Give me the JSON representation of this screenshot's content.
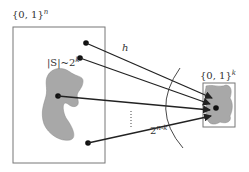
{
  "diagram": {
    "domain_label": "{0, 1}",
    "domain_exp": "n",
    "range_label": "{0, 1}",
    "range_exp": "k",
    "set_label": "|S|~2",
    "set_exp": "k",
    "function_label": "h",
    "preimage_label": "2",
    "preimage_exp": "n-k",
    "ellipsis": "⋮",
    "colors": {
      "stroke": "#222222",
      "box": "#777777",
      "blob_fill": "#a8a8a8"
    }
  }
}
